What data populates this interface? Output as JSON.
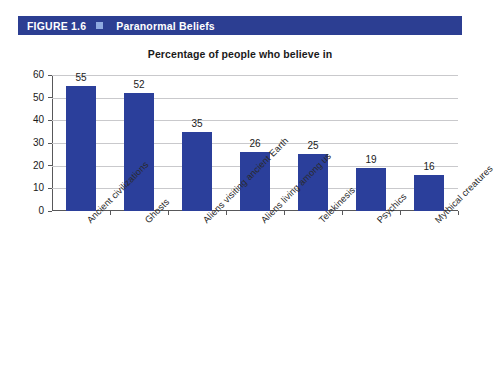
{
  "header": {
    "figure_number": "FIGURE 1.6",
    "title": "Paranormal Beliefs",
    "square_icon": "square-icon",
    "bar_color": "#2c3e92",
    "square_color": "#8fa9e0"
  },
  "chart_data": {
    "type": "bar",
    "title": "Percentage of people who believe in",
    "subtitle": "Percentage of people who believe in",
    "xlabel": "",
    "ylabel": "",
    "ylim": [
      0,
      60
    ],
    "yticks": [
      0,
      10,
      20,
      30,
      40,
      50,
      60
    ],
    "ytick_labels": [
      "0",
      "10",
      "20",
      "30",
      "40",
      "50",
      "60"
    ],
    "grid": true,
    "legend": false,
    "bar_color": "#2b3f9b",
    "categories": [
      "Ancient civilizations",
      "Ghosts",
      "Aliens visiting ancient Earth",
      "Aliens living among us",
      "Telekinesis",
      "Psychics",
      "Mythical creatures"
    ],
    "values": [
      55,
      52,
      35,
      26,
      25,
      19,
      16
    ],
    "value_labels": [
      "55",
      "52",
      "35",
      "26",
      "25",
      "19",
      "16"
    ]
  }
}
